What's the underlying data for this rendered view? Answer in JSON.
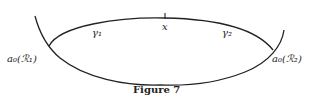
{
  "figure": {
    "caption": "Figure 7",
    "labels": {
      "gamma1": "γ₁",
      "gamma2": "γ₂",
      "x": "x",
      "a0_R1": "a₀(ℛ₁)",
      "a0_R2": "a₀(ℛ₂)"
    },
    "stroke_color": "#222222"
  }
}
